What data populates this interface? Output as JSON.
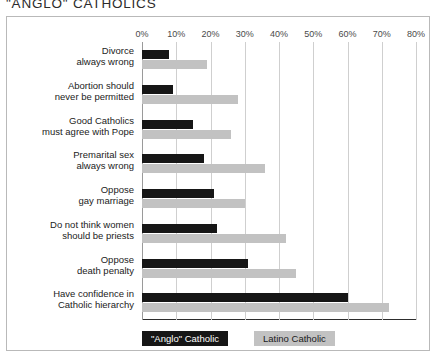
{
  "chart_data": {
    "type": "bar",
    "orientation": "horizontal",
    "title": "\"ANGLO\" CATHOLICS",
    "xlabel": "",
    "ylabel": "",
    "xlim": [
      0,
      80
    ],
    "grid": true,
    "legend_position": "bottom",
    "x_tick_labels": [
      "0%",
      "10%",
      "20%",
      "30%",
      "40%",
      "50%",
      "60%",
      "70%",
      "80%"
    ],
    "x_tick_values": [
      0,
      10,
      20,
      30,
      40,
      50,
      60,
      70,
      80
    ],
    "categories": [
      [
        "Divorce",
        "always wrong"
      ],
      [
        "Abortion should",
        "never be permitted"
      ],
      [
        "Good Catholics",
        "must agree with Pope"
      ],
      [
        "Premarital sex",
        "always wrong"
      ],
      [
        "Oppose",
        "gay marriage"
      ],
      [
        "Do not think women",
        "should be priests"
      ],
      [
        "Oppose",
        "death penalty"
      ],
      [
        "Have confidence in",
        "Catholic hierarchy"
      ]
    ],
    "series": [
      {
        "name": "\"Anglo\" Catholic",
        "color": "#161616",
        "values": [
          8,
          9,
          15,
          18,
          21,
          22,
          31,
          60
        ]
      },
      {
        "name": "Latino Catholic",
        "color": "#c2c2c2",
        "values": [
          19,
          28,
          26,
          36,
          30,
          42,
          45,
          72
        ]
      }
    ]
  }
}
